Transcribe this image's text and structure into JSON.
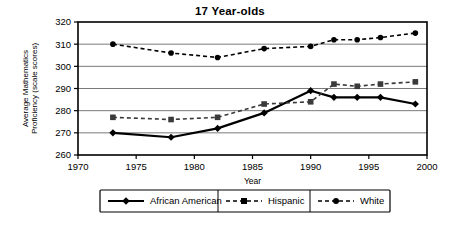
{
  "chart_data": {
    "type": "line",
    "title": "17 Year-olds",
    "xlabel": "Year",
    "ylabel": "Average Mathematics Proficiency (scale scores)",
    "ylabel_line1": "Average Mathematics",
    "ylabel_line2": "Proficiency (scale scores)",
    "xlim": [
      1970,
      2000
    ],
    "ylim": [
      260,
      320
    ],
    "xticks": [
      1970,
      1975,
      1980,
      1985,
      1990,
      1995,
      2000
    ],
    "xtick_labels": [
      "1970",
      "1975",
      "1980",
      "1985",
      "1990",
      "1995",
      "2000"
    ],
    "yticks": [
      260,
      270,
      280,
      290,
      300,
      310,
      320
    ],
    "ytick_labels": [
      "260",
      "270",
      "280",
      "290",
      "300",
      "310",
      "320"
    ],
    "grid": true,
    "grid_axis": "y",
    "legend_position": "bottom",
    "x": [
      1973,
      1978,
      1982,
      1986,
      1990,
      1992,
      1994,
      1996,
      1999
    ],
    "series": [
      {
        "name": "African American",
        "marker": "diamond",
        "linestyle": "solid",
        "color": "#000000",
        "values": [
          270,
          268,
          272,
          279,
          289,
          286,
          286,
          286,
          283
        ]
      },
      {
        "name": "Hispanic",
        "marker": "square",
        "linestyle": "dashed",
        "color": "#3a3a3a",
        "values": [
          277,
          276,
          277,
          283,
          284,
          292,
          291,
          292,
          293
        ]
      },
      {
        "name": "White",
        "marker": "circle",
        "linestyle": "dashed",
        "color": "#000000",
        "values": [
          310,
          306,
          304,
          308,
          309,
          312,
          312,
          313,
          315
        ]
      }
    ]
  },
  "legend": {
    "items": [
      {
        "label": "African American",
        "marker": "diamond",
        "linestyle": "solid"
      },
      {
        "label": "Hispanic",
        "marker": "square",
        "linestyle": "dashed"
      },
      {
        "label": "White",
        "marker": "circle",
        "linestyle": "dashed"
      }
    ]
  }
}
